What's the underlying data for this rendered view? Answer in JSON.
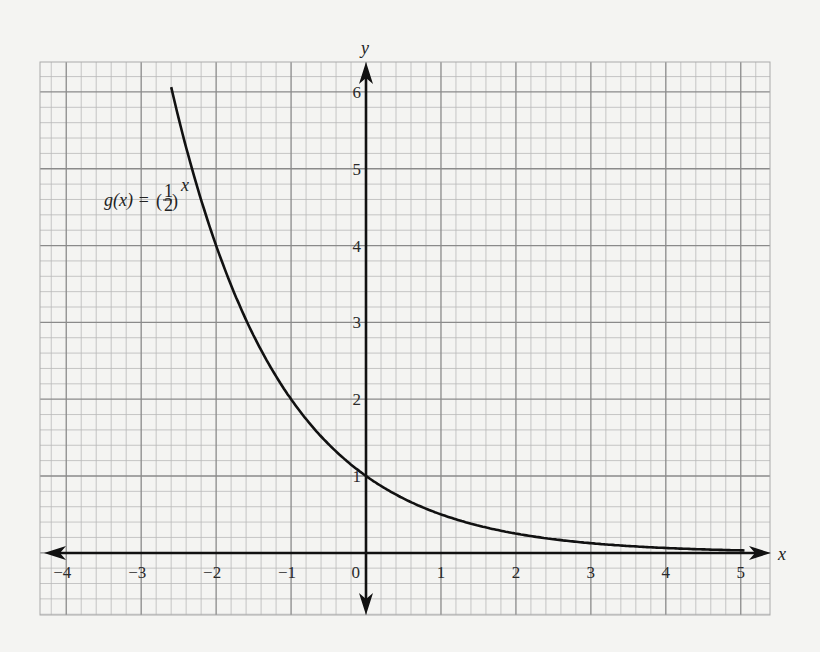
{
  "chart_data": {
    "type": "line",
    "title": "",
    "xlabel": "x",
    "ylabel": "y",
    "xlim": [
      -4.35,
      5.39
    ],
    "ylim": [
      -0.81,
      6.39
    ],
    "grid": true,
    "grid_minor_divisions": 5,
    "x_ticks": [
      -4,
      -3,
      -2,
      -1,
      0,
      1,
      2,
      3,
      4,
      5
    ],
    "x_tick_labels": [
      "−4",
      "−3",
      "−2",
      "−1",
      "0",
      "1",
      "2",
      "3",
      "4",
      "5"
    ],
    "y_ticks": [
      1,
      2,
      3,
      4,
      5,
      6
    ],
    "y_tick_labels": [
      "1",
      "2",
      "3",
      "4",
      "5",
      "6"
    ],
    "series": [
      {
        "name": "g(x) = (1/2)^x",
        "function": "(1/2)^x",
        "x": [
          -2.6,
          -2.5,
          -2,
          -1.5,
          -1,
          -0.5,
          0,
          0.5,
          1,
          1.5,
          2,
          2.5,
          3,
          3.5,
          4,
          4.5,
          5
        ],
        "values": [
          6.06,
          5.66,
          4,
          2.83,
          2,
          1.41,
          1,
          0.71,
          0.5,
          0.35,
          0.25,
          0.18,
          0.125,
          0.09,
          0.0625,
          0.044,
          0.031
        ]
      }
    ],
    "annotations": [
      {
        "text": "g(x) = (1/2)^x",
        "position": "upper-left, near x=-3.5, y=4.6"
      }
    ]
  },
  "labels": {
    "x_axis": "x",
    "y_axis": "y",
    "function_lhs": "g(x) = ",
    "function_base_num": "1",
    "function_base_den": "2",
    "function_exponent": "x"
  },
  "colors": {
    "background": "#f4f4f2",
    "grid_minor": "#b9b9b9",
    "grid_major": "#8a8a8a",
    "axis": "#111111",
    "curve": "#111111"
  }
}
